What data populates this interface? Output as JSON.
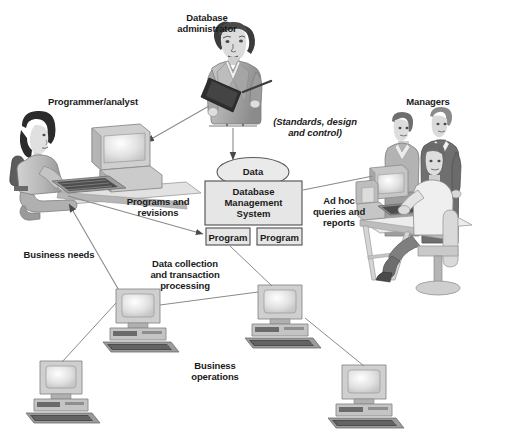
{
  "diagram": {
    "title_partial_top": "",
    "background": "#ffffff",
    "ink": "#1a1a1a",
    "line_color": "#8a8a8a",
    "fill_light": "#e3e3e3",
    "fill_mid": "#c2c2c2",
    "fill_dark": "#8f8f8f"
  },
  "labels": {
    "database_administrator": "Database\nadministrator",
    "programmer_analyst": "Programmer/analyst",
    "managers": "Managers",
    "standards_design_control": "(Standards, design\nand control)",
    "programs_and_revisions": "Programs and\nrevisions",
    "ad_hoc_queries_reports": "Ad hoc\nqueries and\nreports",
    "business_needs": "Business needs",
    "data_collection_transaction": "Data collection\nand transaction\nprocessing",
    "business_operations": "Business\noperations"
  },
  "nodes": {
    "data_ellipse": "Data",
    "dbms_box": "Database\nManagement\nSystem",
    "program_left": "Program",
    "program_right": "Program"
  },
  "figures": {
    "dba": "database-administrator-person",
    "programmer": "programmer-analyst-person-at-computer",
    "managers_group": "managers-group-at-computer",
    "workstation_1": "desktop-computer",
    "workstation_2": "desktop-computer",
    "workstation_3": "desktop-computer",
    "workstation_4": "desktop-computer"
  }
}
